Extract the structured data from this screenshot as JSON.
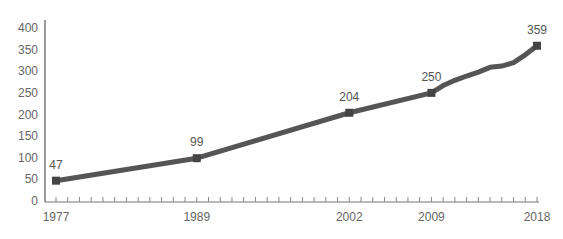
{
  "chart_data": {
    "type": "line",
    "title": "",
    "xlabel": "",
    "ylabel": "",
    "ylim": [
      0,
      400
    ],
    "xlim": [
      1977,
      2018
    ],
    "grid": false,
    "legend": null,
    "yticks": [
      0,
      50,
      100,
      150,
      200,
      250,
      300,
      350,
      400
    ],
    "xtick_labels": [
      1977,
      1989,
      2002,
      2009,
      2018
    ],
    "x": [
      1977,
      1989,
      2002,
      2009,
      2010,
      2011,
      2012,
      2013,
      2014,
      2015,
      2016,
      2017,
      2018
    ],
    "series": [
      {
        "name": "Value",
        "values": [
          47,
          99,
          204,
          250,
          267,
          279,
          289,
          298,
          309,
          312,
          320,
          338,
          359
        ],
        "color": "#555555"
      }
    ],
    "annotations": [
      {
        "x": 1977,
        "label": "47"
      },
      {
        "x": 1989,
        "label": "99"
      },
      {
        "x": 2002,
        "label": "204"
      },
      {
        "x": 2009,
        "label": "250"
      },
      {
        "x": 2018,
        "label": "359"
      }
    ]
  }
}
